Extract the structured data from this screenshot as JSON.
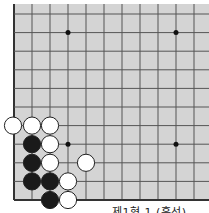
{
  "board": {
    "background": "#d4d4d4",
    "line_color": "#555555",
    "edge_color": "#333333",
    "origin_x": 14,
    "origin_y": 200,
    "spacing_x": 18,
    "spacing_y": 18.6,
    "visible_columns": 11,
    "visible_rows": 11,
    "star_points": [
      [
        3,
        3
      ],
      [
        9,
        3
      ],
      [
        3,
        9
      ],
      [
        9,
        9
      ]
    ],
    "stones": [
      {
        "color": "white",
        "col": 0,
        "row": 4
      },
      {
        "color": "white",
        "col": 1,
        "row": 4
      },
      {
        "color": "white",
        "col": 2,
        "row": 4
      },
      {
        "color": "black",
        "col": 1,
        "row": 3
      },
      {
        "color": "white",
        "col": 2,
        "row": 3
      },
      {
        "color": "black",
        "col": 1,
        "row": 2
      },
      {
        "color": "white",
        "col": 2,
        "row": 2
      },
      {
        "color": "white",
        "col": 4,
        "row": 2
      },
      {
        "color": "black",
        "col": 1,
        "row": 1
      },
      {
        "color": "black",
        "col": 2,
        "row": 1
      },
      {
        "color": "white",
        "col": 3,
        "row": 1
      },
      {
        "color": "black",
        "col": 2,
        "row": 0
      },
      {
        "color": "white",
        "col": 3,
        "row": 0
      }
    ]
  },
  "caption": "제1형 1 (흑선)"
}
